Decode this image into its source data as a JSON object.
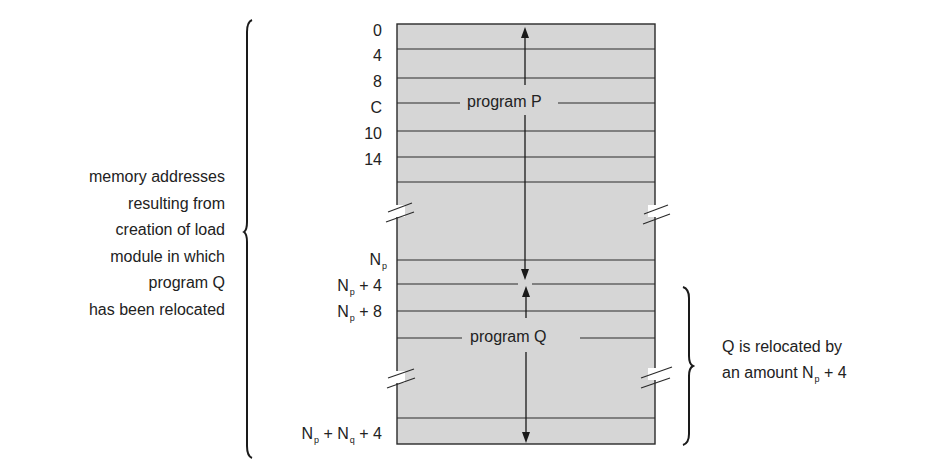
{
  "diagram": {
    "memory_block": {
      "fill_color": "#d6d6d6",
      "line_color": "#2a2a2a",
      "left": 397,
      "right": 655,
      "top": 24,
      "bottom": 444,
      "row_lines_y": [
        49,
        78,
        131,
        157,
        182,
        260,
        284,
        311,
        418
      ],
      "label_lines_y": [
        103,
        338
      ]
    },
    "programs": [
      {
        "label": "program P",
        "label_y": 103
      },
      {
        "label": "program Q",
        "label_y": 338
      }
    ],
    "addresses": [
      {
        "text": "0",
        "sub": "",
        "tail": "",
        "y": 28
      },
      {
        "text": "4",
        "sub": "",
        "tail": "",
        "y": 53
      },
      {
        "text": "8",
        "sub": "",
        "tail": "",
        "y": 79
      },
      {
        "text": "C",
        "sub": "",
        "tail": "",
        "y": 105
      },
      {
        "text": "10",
        "sub": "",
        "tail": "",
        "y": 131
      },
      {
        "text": "14",
        "sub": "",
        "tail": "",
        "y": 157
      },
      {
        "text": "N",
        "sub": "p",
        "tail": "",
        "y": 257
      },
      {
        "text": "N",
        "sub": "p",
        "tail": " + 4",
        "y": 283
      },
      {
        "text": "N",
        "sub": "p",
        "tail": " + 8",
        "y": 309
      },
      {
        "text": "N",
        "sub": "p",
        "tail": " + N",
        "sub2": "q",
        "tail2": " + 4",
        "y": 425
      }
    ],
    "left_annotation": {
      "lines": [
        "memory addresses",
        "resulting from",
        "creation of load",
        "module in which",
        "program Q",
        "has been relocated"
      ]
    },
    "right_annotation": {
      "line1": "Q is relocated by",
      "line2_prefix": "an amount N",
      "line2_sub": "p",
      "line2_suffix": " + 4"
    }
  }
}
